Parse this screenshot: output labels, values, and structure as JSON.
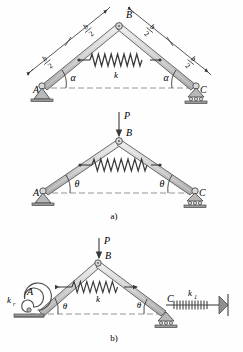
{
  "figure": {
    "type": "engineering-mechanics-diagram",
    "colors": {
      "member_fill": "#cfcfcf",
      "member_stroke": "#5a5a5a",
      "spring_stroke": "#3a3a3a",
      "support_fill": "#b0b0b0",
      "support_stroke": "#4a4a4a",
      "text": "#1a1a1a",
      "dash_line": "#8a8a8a",
      "background": "#ffffff"
    },
    "captions": [
      {
        "id": "caption-a",
        "text": "a)"
      },
      {
        "id": "caption-b",
        "text": "b)"
      }
    ],
    "panels": [
      {
        "id": "panel-top",
        "name": "undeformed-frame-with-dimensions",
        "joints": [
          {
            "name": "A",
            "label": "A",
            "support": "pin"
          },
          {
            "name": "B",
            "label": "B",
            "support": "none"
          },
          {
            "name": "C",
            "label": "C",
            "support": "roller"
          }
        ],
        "angles": [
          {
            "label": "α",
            "at": "A"
          },
          {
            "label": "α",
            "at": "C"
          }
        ],
        "spring": {
          "label": "k",
          "type": "coil"
        },
        "dimensions": [
          {
            "label_numerator": "b",
            "label_denominator": "2",
            "member": "AB-lower"
          },
          {
            "label_numerator": "b",
            "label_denominator": "2",
            "member": "AB-upper"
          },
          {
            "label_numerator": "b",
            "label_denominator": "2",
            "member": "BC-upper"
          },
          {
            "label_numerator": "b",
            "label_denominator": "2",
            "member": "BC-lower"
          }
        ]
      },
      {
        "id": "panel-middle",
        "name": "loaded-frame",
        "caption": "a)",
        "joints": [
          {
            "name": "A",
            "label": "A",
            "support": "pin"
          },
          {
            "name": "B",
            "label": "B",
            "support": "none"
          },
          {
            "name": "C",
            "label": "C",
            "support": "roller"
          }
        ],
        "load": {
          "label": "P",
          "direction": "down",
          "applied_at": "B"
        },
        "angles": [
          {
            "label": "θ",
            "at": "A"
          },
          {
            "label": "θ",
            "at": "C"
          }
        ],
        "spring": {
          "label": "",
          "type": "coil"
        }
      },
      {
        "id": "panel-bottom",
        "name": "frame-with-rotational-and-linear-springs",
        "caption": "b)",
        "joints": [
          {
            "name": "A",
            "label": "A",
            "support": "rotational-spring"
          },
          {
            "name": "B",
            "label": "B",
            "support": "none"
          },
          {
            "name": "C",
            "label": "C",
            "support": "roller"
          }
        ],
        "load": {
          "label": "P",
          "direction": "down",
          "applied_at": "B"
        },
        "angles": [
          {
            "label": "θ",
            "at": "A"
          },
          {
            "label": "θ",
            "at": "C"
          }
        ],
        "springs": [
          {
            "label": "k",
            "type": "coil",
            "location": "tie-between-members"
          },
          {
            "label_base": "k",
            "label_sub": "r",
            "type": "spiral",
            "location": "at-A"
          },
          {
            "label_base": "k",
            "label_sub": "1",
            "type": "coil",
            "location": "right-of-C"
          }
        ]
      }
    ]
  }
}
